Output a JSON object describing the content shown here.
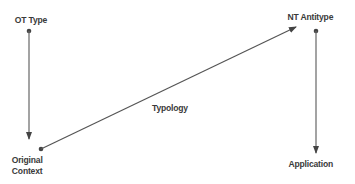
{
  "diagram": {
    "nodes": {
      "ot_type": {
        "label": "OT Type"
      },
      "nt_antitype": {
        "label": "NT Antitype"
      },
      "original_context": {
        "label_line1": "Original",
        "label_line2": "Context"
      },
      "application": {
        "label": "Application"
      }
    },
    "edges": [
      {
        "from": "OT Type",
        "to": "Original Context",
        "label": ""
      },
      {
        "from": "Original Context",
        "to": "NT Antitype",
        "label": "Typology"
      },
      {
        "from": "NT Antitype",
        "to": "Application",
        "label": ""
      }
    ],
    "edge_labels": {
      "typology": "Typology"
    },
    "colors": {
      "line": "#555555",
      "text": "#3a3a3a",
      "background": "#ffffff"
    }
  }
}
